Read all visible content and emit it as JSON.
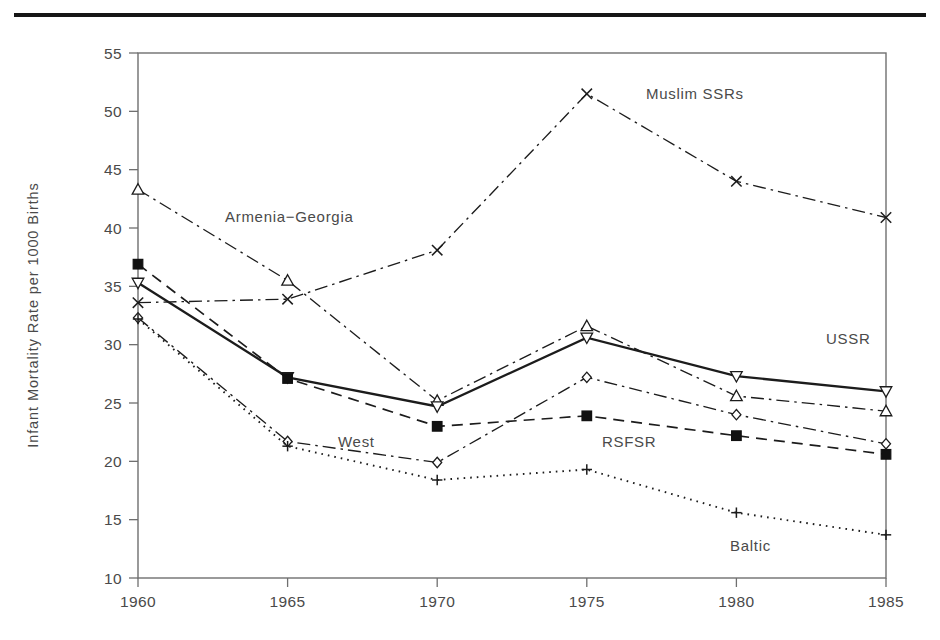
{
  "page": {
    "background_color": "#ffffff",
    "rule_color": "#161616"
  },
  "axis": {
    "y_title": "Infant Mortality Rate per 1000 Births",
    "x_title": "",
    "y_ticks": [
      "10",
      "15",
      "20",
      "25",
      "30",
      "35",
      "40",
      "45",
      "50",
      "55"
    ],
    "x_ticks": [
      "1960",
      "1965",
      "1970",
      "1975",
      "1980",
      "1985"
    ]
  },
  "labels": {
    "armenia_georgia": "Armenia−Georgia",
    "muslim_ssrs": "Muslim SSRs",
    "ussr": "USSR",
    "rsfsr": "RSFSR",
    "west": "West",
    "baltic": "Baltic"
  },
  "chart_data": {
    "type": "line",
    "title": "",
    "xlabel": "",
    "ylabel": "Infant Mortality Rate per 1000 Births",
    "x": [
      1960,
      1965,
      1970,
      1975,
      1980,
      1985
    ],
    "xlim": [
      1960,
      1985
    ],
    "ylim": [
      10,
      55
    ],
    "y_tick_step": 5,
    "grid": false,
    "legend": "inline-annotations",
    "series": [
      {
        "name": "Muslim SSRs",
        "marker": "x",
        "line_style": "dash-dot",
        "color": "#1c1c1c",
        "values": [
          33.6,
          33.9,
          38.1,
          51.5,
          44.0,
          40.9
        ]
      },
      {
        "name": "Armenia−Georgia",
        "marker": "triangle-up",
        "line_style": "dash-dot",
        "color": "#1c1c1c",
        "values": [
          43.3,
          35.5,
          25.2,
          31.6,
          25.6,
          24.3
        ]
      },
      {
        "name": "USSR",
        "marker": "triangle-down",
        "line_style": "solid",
        "color": "#1c1c1c",
        "values": [
          35.3,
          27.2,
          24.7,
          30.6,
          27.3,
          26.0
        ]
      },
      {
        "name": "RSFSR",
        "marker": "square-filled",
        "line_style": "dashed",
        "color": "#111111",
        "values": [
          36.9,
          27.1,
          23.0,
          23.9,
          22.2,
          20.6
        ]
      },
      {
        "name": "West",
        "marker": "diamond",
        "line_style": "dash-dot",
        "color": "#1c1c1c",
        "values": [
          32.3,
          21.7,
          19.9,
          27.2,
          24.0,
          21.5
        ]
      },
      {
        "name": "Baltic",
        "marker": "plus",
        "line_style": "dotted",
        "color": "#1c1c1c",
        "values": [
          32.2,
          21.3,
          18.4,
          19.3,
          15.6,
          13.7
        ]
      }
    ]
  }
}
